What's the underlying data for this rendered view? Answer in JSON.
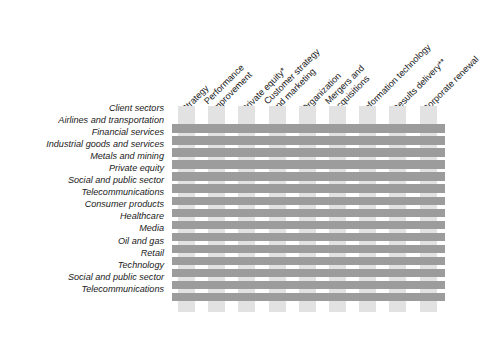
{
  "chart_data": {
    "type": "heatmap",
    "title": "",
    "xlabel": "",
    "ylabel": "",
    "grid": true,
    "legend": "none",
    "orientation": "matrix",
    "columns": [
      {
        "id": "strategy",
        "lines": [
          "Strategy"
        ],
        "label": "Strategy"
      },
      {
        "id": "performance-improvement",
        "lines": [
          "Performance",
          "improvement"
        ],
        "label": "Performance improvement"
      },
      {
        "id": "private-equity",
        "lines": [
          "Private equity*"
        ],
        "label": "Private equity*"
      },
      {
        "id": "customer-strategy-and-marketing",
        "lines": [
          "Customer strategy",
          "and marketing"
        ],
        "label": "Customer strategy and marketing"
      },
      {
        "id": "organization",
        "lines": [
          "Organization"
        ],
        "label": "Organization"
      },
      {
        "id": "mergers-and-acquisitions",
        "lines": [
          "Mergers and",
          "acquisitions"
        ],
        "label": "Mergers and acquisitions"
      },
      {
        "id": "information-technology",
        "lines": [
          "Information technology"
        ],
        "label": "Information technology"
      },
      {
        "id": "results-delivery",
        "lines": [
          "Results delivery**"
        ],
        "label": "Results delivery**"
      },
      {
        "id": "corporate-renewal",
        "lines": [
          "Corporate renewal"
        ],
        "label": "Corporate renewal"
      }
    ],
    "row_header": "Client sectors",
    "categories": [
      "Airlines and transportation",
      "Financial services",
      "Industrial goods and services",
      "Metals and mining",
      "Private equity",
      "Social and public sector",
      "Telecommunications",
      "Consumer products",
      "Healthcare",
      "Media",
      "Oil and gas",
      "Retail",
      "Technology",
      "Social and public sector",
      "Telecommunications"
    ],
    "values": [
      [
        1,
        1,
        1,
        1,
        1,
        1,
        1,
        1,
        1
      ],
      [
        1,
        1,
        1,
        1,
        1,
        1,
        1,
        1,
        1
      ],
      [
        1,
        1,
        1,
        1,
        1,
        1,
        1,
        1,
        1
      ],
      [
        1,
        1,
        1,
        1,
        1,
        1,
        1,
        1,
        1
      ],
      [
        1,
        1,
        1,
        1,
        1,
        1,
        1,
        1,
        1
      ],
      [
        1,
        1,
        1,
        1,
        1,
        1,
        1,
        1,
        1
      ],
      [
        1,
        1,
        1,
        1,
        1,
        1,
        1,
        1,
        1
      ],
      [
        1,
        1,
        1,
        1,
        1,
        1,
        1,
        1,
        1
      ],
      [
        1,
        1,
        1,
        1,
        1,
        1,
        1,
        1,
        1
      ],
      [
        1,
        1,
        1,
        1,
        1,
        1,
        1,
        1,
        1
      ],
      [
        1,
        1,
        1,
        1,
        1,
        1,
        1,
        1,
        1
      ],
      [
        1,
        1,
        1,
        1,
        1,
        1,
        1,
        1,
        1
      ],
      [
        1,
        1,
        1,
        1,
        1,
        1,
        1,
        1,
        1
      ],
      [
        1,
        1,
        1,
        1,
        1,
        1,
        1,
        1,
        1
      ],
      [
        1,
        1,
        1,
        1,
        1,
        1,
        1,
        1,
        1
      ]
    ]
  },
  "colors": {
    "row_bar": "#9c9c9c",
    "column_bar": "#e2e2e2",
    "text": "#1a1a1a",
    "background": "#ffffff"
  }
}
